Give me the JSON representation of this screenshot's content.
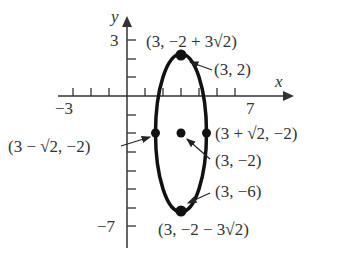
{
  "axes": {
    "x_label": "x",
    "y_label": "y",
    "x_tick_labels": {
      "neg": "−3",
      "pos": "7"
    },
    "y_tick_labels": {
      "pos": "3",
      "neg": "−7"
    }
  },
  "ellipse": {
    "center": "(3, −2)",
    "equation_hint": "vertical ellipse centered at (3, −2)"
  },
  "points": [
    {
      "id": "top-vertex",
      "label": "(3, −2 + 3√2)"
    },
    {
      "id": "focus-top",
      "label": "(3, 2)"
    },
    {
      "id": "right-covertex",
      "label": "(3 + √2, −2)"
    },
    {
      "id": "left-covertex",
      "label": "(3 − √2, −2)"
    },
    {
      "id": "center",
      "label": "(3, −2)"
    },
    {
      "id": "focus-bottom",
      "label": "(3, −6)"
    },
    {
      "id": "bottom-vertex",
      "label": "(3, −2 − 3√2)"
    }
  ],
  "colors": {
    "ink": "#111111",
    "text": "#333333"
  }
}
